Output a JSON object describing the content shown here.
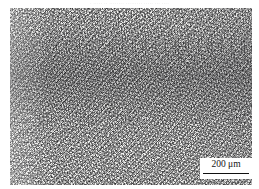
{
  "figure": {
    "type": "optical-micrograph",
    "top_caption": "· ····· ·· ········ ········· ····· ··· ····",
    "bottom_note": "·· ····· ······ ··"
  },
  "scalebar": {
    "label": "200 μm",
    "value": "200",
    "unit": "μm"
  },
  "colors": {
    "page_background": "#ffffff",
    "plate_base": "#f2f2f0",
    "grain_dark": "#1e1e21",
    "scalebar_box": "#ffffff",
    "scalebar_ink": "#101010",
    "caption_ink": "#b9b9b9"
  }
}
